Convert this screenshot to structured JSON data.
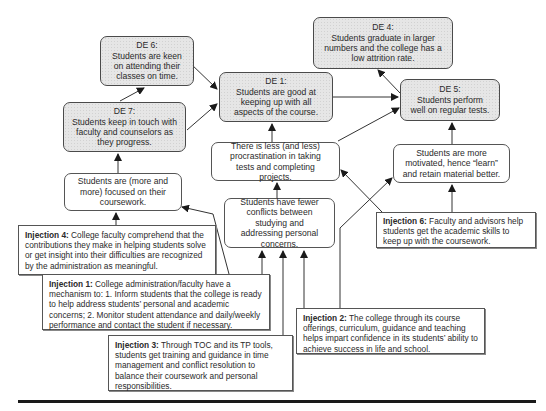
{
  "diagram": {
    "type": "TOC Future Reality Tree",
    "desirable_effects": [
      {
        "id": "de6",
        "title": "DE 6:",
        "text": "Students are keen on attending their classes on time."
      },
      {
        "id": "de1",
        "title": "DE 1:",
        "text": "Students are good at keeping up with all aspects of the course."
      },
      {
        "id": "de4",
        "title": "DE 4:",
        "text": "Students graduate in larger numbers and the college has a low attrition rate."
      },
      {
        "id": "de5",
        "title": "DE 5:",
        "text": "Students perform well on regular tests."
      },
      {
        "id": "de7",
        "title": "DE 7:",
        "text": "Students keep in touch with faculty and counselors as they progress."
      }
    ],
    "entities": [
      {
        "id": "procrastination",
        "text": "There is less (and less) procrastination in taking tests and completing projects."
      },
      {
        "id": "motivated",
        "text": "Students are more motivated, hence “learn” and retain material better."
      },
      {
        "id": "focused",
        "text": "Students are (more and more) focused on their coursework."
      },
      {
        "id": "conflicts",
        "text": "Students have fewer conflicts between studying and addressing personal concerns."
      }
    ],
    "injections": [
      {
        "id": "inj4",
        "label": "Injection 4:",
        "text": " College faculty comprehend that the contributions they make in helping students solve or get insight into their difficulties are recognized by the administration as meaningful."
      },
      {
        "id": "inj6",
        "label": "Injection 6:",
        "text": " Faculty and advisors help students get the academic skills to keep up with the coursework."
      },
      {
        "id": "inj1",
        "label": "Injection 1:",
        "text": " College administration/faculty have a mechanism to: 1. Inform students that the college is ready to help address students’ personal and academic concerns; 2. Monitor student attendance and daily/weekly performance and contact the student if necessary."
      },
      {
        "id": "inj2",
        "label": "Injection 2:",
        "text": " The college through its course offerings, curriculum, guidance and teaching helps impart confidence in its students’ ability to achieve success in life and school."
      },
      {
        "id": "inj3",
        "label": "Injection 3:",
        "text": " Through TOC and its TP tools, students get training and guidance in time management and conflict resolution to balance their coursework and personal responsibilities."
      }
    ],
    "edges": [
      {
        "from": "de6",
        "to": "de1"
      },
      {
        "from": "de7",
        "to": "de1"
      },
      {
        "from": "de7",
        "to": "de6"
      },
      {
        "from": "de1",
        "to": "de5"
      },
      {
        "from": "de5",
        "to": "de4"
      },
      {
        "from": "procrastination",
        "to": "de1"
      },
      {
        "from": "procrastination",
        "to": "de5"
      },
      {
        "from": "motivated",
        "to": "de5"
      },
      {
        "from": "focused",
        "to": "de7"
      },
      {
        "from": "conflicts",
        "to": "procrastination"
      },
      {
        "from": "inj4",
        "to": "focused"
      },
      {
        "from": "inj1",
        "to": "focused"
      },
      {
        "from": "inj1",
        "to": "conflicts"
      },
      {
        "from": "inj3",
        "to": "conflicts"
      },
      {
        "from": "inj2",
        "to": "conflicts"
      },
      {
        "from": "inj2",
        "to": "motivated"
      },
      {
        "from": "inj6",
        "to": "procrastination"
      },
      {
        "from": "inj6",
        "to": "motivated"
      }
    ],
    "colors": {
      "de_fill": "#e6e6e6",
      "entity_fill": "#ffffff",
      "stroke": "#4a4a4a",
      "arrow": "#1a1a1a"
    }
  }
}
